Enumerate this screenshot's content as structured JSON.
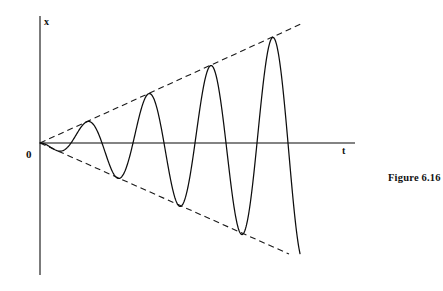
{
  "figure": {
    "caption": "Figure 6.16",
    "background_color": "#ffffff",
    "width": 443,
    "height": 291
  },
  "axes": {
    "y_axis_label": "x",
    "x_axis_label": "t",
    "origin_label": "0",
    "axis_color": "#5a5a5a",
    "y_axis": {
      "x": 40,
      "y_top": 16,
      "y_bottom": 275
    },
    "x_axis": {
      "y": 143,
      "x_left": 40,
      "x_right": 355
    }
  },
  "chart_data": {
    "type": "line",
    "title": "Figure 6.16",
    "xlabel": "t",
    "ylabel": "x",
    "grid": false,
    "legend": null,
    "curve_color": "#0d0d0d",
    "envelope_color": "#1a1a1a",
    "envelope_style": "dashed",
    "x_range_px": [
      40,
      300
    ],
    "y_zero_px": 143,
    "growth_per_px": 0.4538,
    "period_px": 62,
    "phase_start": "negative",
    "series": [
      {
        "name": "oscillation",
        "key_points_px": [
          {
            "t": 40,
            "x": 143,
            "kind": "origin"
          },
          {
            "t": 74,
            "x": 166,
            "kind": "trough"
          },
          {
            "t": 105,
            "x": 117,
            "kind": "peak"
          },
          {
            "t": 137,
            "x": 189,
            "kind": "trough"
          },
          {
            "t": 168,
            "x": 90,
            "kind": "peak"
          },
          {
            "t": 198,
            "x": 214,
            "kind": "trough"
          },
          {
            "t": 229,
            "x": 61,
            "kind": "peak"
          },
          {
            "t": 257,
            "x": 241,
            "kind": "trough"
          },
          {
            "t": 290,
            "x": 30,
            "kind": "peak"
          },
          {
            "t": 299,
            "x": 108,
            "kind": "end"
          }
        ]
      },
      {
        "name": "upper-envelope",
        "line_px": [
          {
            "t": 40,
            "x": 143
          },
          {
            "t": 301,
            "x": 24
          }
        ]
      },
      {
        "name": "lower-envelope",
        "line_px": [
          {
            "t": 40,
            "x": 143
          },
          {
            "t": 289,
            "x": 254
          }
        ]
      }
    ]
  }
}
